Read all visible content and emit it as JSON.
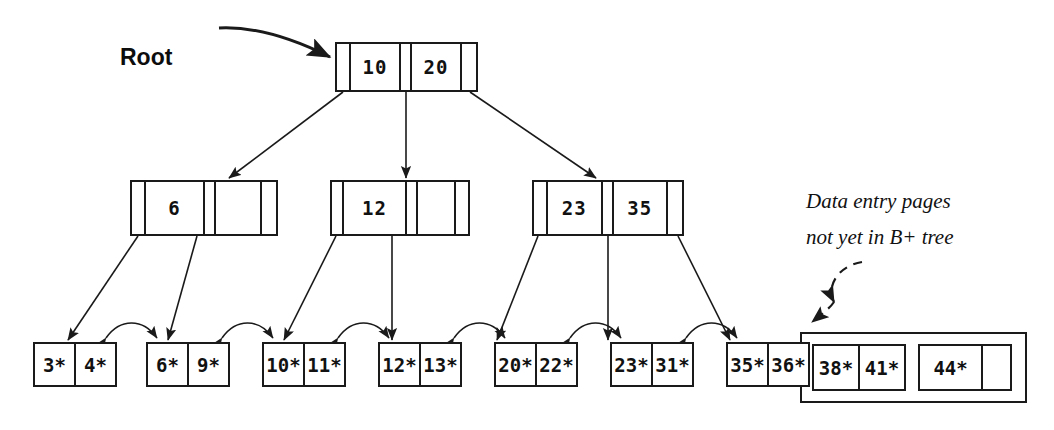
{
  "diagram": {
    "background_color": "#ffffff",
    "line_color": "#1a1a1a"
  },
  "labels": {
    "root": "Root",
    "annotation_line1": "Data entry pages",
    "annotation_line2": "not yet in B+ tree"
  },
  "root_node": {
    "keys": [
      "10",
      "20"
    ]
  },
  "internal_nodes": [
    {
      "keys": [
        "6",
        ""
      ]
    },
    {
      "keys": [
        "12",
        ""
      ]
    },
    {
      "keys": [
        "23",
        "35"
      ]
    }
  ],
  "leaf_nodes": [
    {
      "entries": [
        "3*",
        "4*"
      ]
    },
    {
      "entries": [
        "6*",
        "9*"
      ]
    },
    {
      "entries": [
        "10*",
        "11*"
      ]
    },
    {
      "entries": [
        "12*",
        "13*"
      ]
    },
    {
      "entries": [
        "20*",
        "22*"
      ]
    },
    {
      "entries": [
        "23*",
        "31*"
      ]
    },
    {
      "entries": [
        "35*",
        "36*"
      ]
    }
  ],
  "detached_pages": [
    {
      "entries": [
        "38*",
        "41*"
      ]
    },
    {
      "entries": [
        "44*",
        ""
      ]
    }
  ]
}
